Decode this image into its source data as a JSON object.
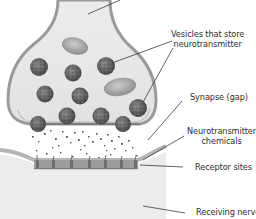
{
  "diagram": {
    "type": "synapse-illustration",
    "labels": {
      "vesicles": [
        "Vesicles that store",
        "neurotransmitter"
      ],
      "synapse": "Synapse (gap)",
      "neurotransmitter": [
        "Neurotransmitter",
        "chemicals"
      ],
      "receptor": "Receptor sites",
      "receiving": "Receiving nerve"
    },
    "colors": {
      "background": "#ffffff",
      "cell_fill": "#e6e6e6",
      "cell_membrane": "#9a9a9a",
      "vesicle": "#6d6d6d",
      "vesicle_dark": "#4a4a4a",
      "oval_organelle": "#a9a9a9",
      "receptor_band": "#8c8c8c",
      "receiving_fill": "#ececec",
      "leader_line": "#3a3a3a",
      "text": "#2e2e2e"
    }
  }
}
